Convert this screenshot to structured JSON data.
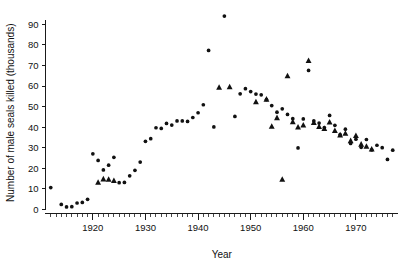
{
  "chart_data": {
    "type": "scatter",
    "title": "",
    "xlabel": "Year",
    "ylabel": "Number of male seals killed (thousands)",
    "xlim": [
      1911,
      1978
    ],
    "ylim": [
      -2,
      96
    ],
    "grid": false,
    "legend": "none",
    "x_major_ticks": [
      1920,
      1930,
      1940,
      1950,
      1960,
      1970
    ],
    "x_tick_labels": [
      "1920",
      "1930",
      "1940",
      "1950",
      "1960",
      "1970"
    ],
    "x_minor_tick_step": 1,
    "y_major_ticks": [
      0,
      10,
      20,
      30,
      40,
      50,
      60,
      70,
      80,
      90
    ],
    "y_tick_labels": [
      "0",
      "10",
      "20",
      "30",
      "40",
      "50",
      "60",
      "70",
      "80",
      "90"
    ],
    "marker_shapes": [
      "circle",
      "triangle"
    ],
    "series": [
      {
        "name": "circle",
        "marker": "circle",
        "points": [
          [
            1912,
            10.6
          ],
          [
            1914,
            2.4
          ],
          [
            1915,
            1.2
          ],
          [
            1916,
            1.3
          ],
          [
            1917,
            3.1
          ],
          [
            1918,
            3.4
          ],
          [
            1919,
            4.9
          ],
          [
            1920,
            27.0
          ],
          [
            1921,
            23.8
          ],
          [
            1922,
            19.2
          ],
          [
            1923,
            21.5
          ],
          [
            1924,
            25.3
          ],
          [
            1925,
            13.0
          ],
          [
            1926,
            13.1
          ],
          [
            1927,
            16.3
          ],
          [
            1928,
            19.0
          ],
          [
            1929,
            23.0
          ],
          [
            1930,
            33.1
          ],
          [
            1931,
            34.4
          ],
          [
            1932,
            39.7
          ],
          [
            1933,
            39.4
          ],
          [
            1934,
            41.8
          ],
          [
            1935,
            41.0
          ],
          [
            1936,
            43.0
          ],
          [
            1937,
            43.0
          ],
          [
            1938,
            42.8
          ],
          [
            1939,
            44.7
          ],
          [
            1940,
            47.0
          ],
          [
            1941,
            50.9
          ],
          [
            1942,
            77.3
          ],
          [
            1943,
            40.1
          ],
          [
            1945,
            94.0
          ],
          [
            1947,
            45.2
          ],
          [
            1948,
            56.2
          ],
          [
            1949,
            58.7
          ],
          [
            1950,
            57.3
          ],
          [
            1951,
            56.1
          ],
          [
            1952,
            55.7
          ],
          [
            1953,
            53.4
          ],
          [
            1954,
            50.5
          ],
          [
            1955,
            47.3
          ],
          [
            1956,
            48.9
          ],
          [
            1957,
            46.2
          ],
          [
            1958,
            44.1
          ],
          [
            1959,
            29.9
          ],
          [
            1960,
            44.0
          ],
          [
            1961,
            67.6
          ],
          [
            1962,
            43.0
          ],
          [
            1963,
            42.0
          ],
          [
            1964,
            39.8
          ],
          [
            1965,
            45.7
          ],
          [
            1966,
            40.9
          ],
          [
            1967,
            36.4
          ],
          [
            1968,
            39.0
          ],
          [
            1969,
            32.1
          ],
          [
            1970,
            34.1
          ],
          [
            1971,
            30.2
          ],
          [
            1972,
            34.0
          ],
          [
            1973,
            28.9
          ],
          [
            1974,
            31.2
          ],
          [
            1975,
            30.0
          ],
          [
            1976,
            24.3
          ],
          [
            1977,
            28.8
          ]
        ]
      },
      {
        "name": "triangle",
        "marker": "triangle",
        "points": [
          [
            1921,
            13.2
          ],
          [
            1922,
            14.8
          ],
          [
            1923,
            14.6
          ],
          [
            1924,
            14.0
          ],
          [
            1944,
            59.4
          ],
          [
            1946,
            59.6
          ],
          [
            1951,
            52.3
          ],
          [
            1953,
            53.6
          ],
          [
            1954,
            40.4
          ],
          [
            1955,
            44.6
          ],
          [
            1956,
            14.6
          ],
          [
            1957,
            65.0
          ],
          [
            1958,
            42.6
          ],
          [
            1959,
            40.0
          ],
          [
            1960,
            41.0
          ],
          [
            1961,
            72.4
          ],
          [
            1962,
            42.2
          ],
          [
            1963,
            40.3
          ],
          [
            1964,
            39.3
          ],
          [
            1965,
            42.5
          ],
          [
            1966,
            38.3
          ],
          [
            1967,
            36.2
          ],
          [
            1968,
            37.0
          ],
          [
            1969,
            33.4
          ],
          [
            1970,
            35.9
          ],
          [
            1971,
            31.7
          ],
          [
            1972,
            30.7
          ],
          [
            1973,
            29.3
          ]
        ]
      }
    ]
  },
  "axes": {
    "x_title": "Year",
    "y_title": "Number of male seals killed (thousands)"
  }
}
